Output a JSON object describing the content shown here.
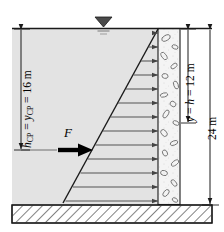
{
  "figure": {
    "labels": {
      "h_cp": "h",
      "h_cp_sub": "CP",
      "h_cp_eq": " = ",
      "y_cp": "y",
      "y_cp_sub": "CP",
      "h_cp_value": " = 16 m",
      "h_cp_full": "h_CP = y_CP = 16 m",
      "y_h": "y",
      "y_h_eq": " = ",
      "h_sym": "h",
      "y_h_value": " = 12 m",
      "y_h_full": "y = h = 12 m",
      "total_depth": "24 m",
      "force": "F"
    },
    "dimensions": {
      "h_cp_m": 16,
      "y_h_m": 12,
      "total_m": 24
    },
    "colors": {
      "water_fill": "#e3e3e3",
      "concrete_fill": "#f2f2f2",
      "foundation_fill": "#ffffff",
      "line": "#1a1a1a",
      "pressure_arrow": "#555555",
      "force_arrow": "#000000"
    },
    "icons": {
      "water_surface": "water-surface-triangle",
      "force": "bold-right-arrow",
      "pressure": "right-arrow"
    },
    "pressure_arrow_count": 12
  }
}
